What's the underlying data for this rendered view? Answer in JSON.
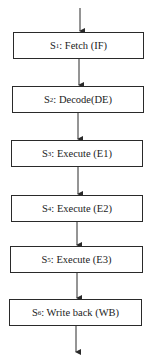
{
  "diagram": {
    "type": "pipeline-flowchart",
    "stages": [
      {
        "id": "S",
        "sub": "1",
        "label": ": Fetch (IF)"
      },
      {
        "id": "S",
        "sub": "2",
        "label": ": Decode(DE)"
      },
      {
        "id": "S",
        "sub": "3",
        "label": ": Execute (E1)"
      },
      {
        "id": "S",
        "sub": "4",
        "label": ": Execute (E2)"
      },
      {
        "id": "S",
        "sub": "5",
        "label": ": Execute (E3)"
      },
      {
        "id": "S",
        "sub": "6",
        "label": ": Write back (WB)"
      }
    ],
    "colors": {
      "stroke": "#2a2a2a",
      "background": "#ffffff"
    }
  }
}
